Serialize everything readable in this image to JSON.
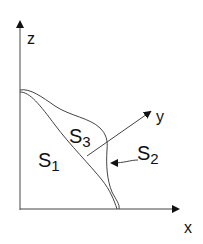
{
  "diagram": {
    "axes": {
      "z": {
        "label": "z"
      },
      "x": {
        "label": "x"
      },
      "y": {
        "label": "y"
      }
    },
    "regions": [
      {
        "id": "S1",
        "main": "S",
        "sub": "1"
      },
      {
        "id": "S2",
        "main": "S",
        "sub": "2"
      },
      {
        "id": "S3",
        "main": "S",
        "sub": "3"
      }
    ],
    "colors": {
      "line": "#333333",
      "text": "#111111",
      "background": "#ffffff"
    }
  }
}
